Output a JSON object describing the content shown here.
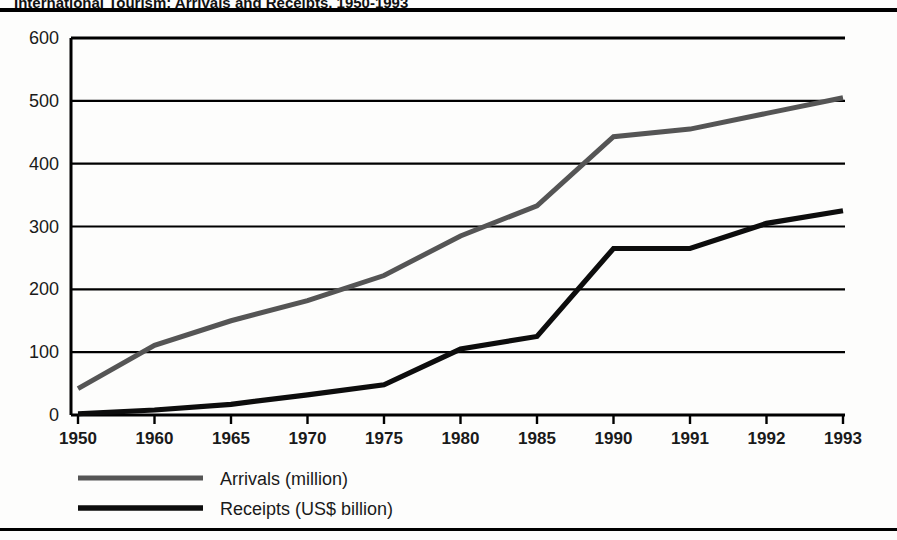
{
  "figure": {
    "title_partial": "International Tourism: Arrivals and Receipts, 1950-1993"
  },
  "chart_data": {
    "type": "line",
    "title": "",
    "xlabel": "",
    "ylabel": "",
    "categories": [
      "1950",
      "1960",
      "1965",
      "1970",
      "1975",
      "1980",
      "1985",
      "1990",
      "1991",
      "1992",
      "1993"
    ],
    "ylim": [
      0,
      600
    ],
    "yticks": [
      0,
      100,
      200,
      300,
      400,
      500,
      600
    ],
    "ytick_labels": [
      "0",
      "100",
      "200",
      "300",
      "400",
      "500",
      "600"
    ],
    "grid": "horizontal",
    "legend_position": "below",
    "series": [
      {
        "name": "Arrivals (million)",
        "color": "#555555",
        "values": [
          42,
          111,
          150,
          182,
          222,
          285,
          333,
          443,
          455,
          480,
          505
        ]
      },
      {
        "name": "Receipts (US$ billion)",
        "color": "#0d0d0d",
        "values": [
          2,
          8,
          17,
          32,
          48,
          105,
          125,
          265,
          265,
          305,
          325
        ]
      }
    ]
  },
  "legend": {
    "items": [
      {
        "label": "Arrivals (million)",
        "color": "#555555"
      },
      {
        "label": "Receipts (US$ billion)",
        "color": "#0d0d0d"
      }
    ]
  }
}
